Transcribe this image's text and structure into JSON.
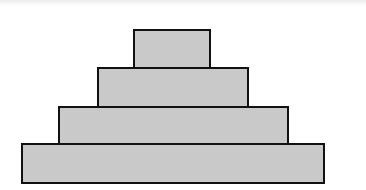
{
  "diagram": {
    "type": "stacked-rectangles-pyramid",
    "tiers": [
      {
        "level": 1,
        "position": "top",
        "x": 133,
        "y": 29,
        "width": 78,
        "height": 40
      },
      {
        "level": 2,
        "position": "upper-middle",
        "x": 97,
        "y": 67,
        "width": 152,
        "height": 41
      },
      {
        "level": 3,
        "position": "lower-middle",
        "x": 58,
        "y": 106,
        "width": 231,
        "height": 40
      },
      {
        "level": 4,
        "position": "bottom",
        "x": 21,
        "y": 143,
        "width": 304,
        "height": 41
      }
    ],
    "colors": {
      "fill": "#c9c9c9",
      "border": "#111111",
      "background": "#ffffff"
    }
  }
}
